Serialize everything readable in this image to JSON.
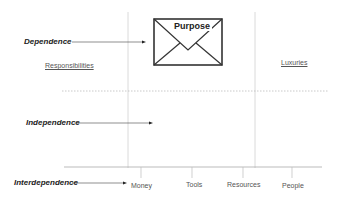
{
  "diagram": {
    "rows": [
      {
        "label": "Dependence"
      },
      {
        "label": "Independence"
      },
      {
        "label": "Interdependence"
      }
    ],
    "quadrant_labels": {
      "left": "Responsibilities",
      "right": "Luxuries"
    },
    "envelope": {
      "title": "Purpose"
    },
    "axis": {
      "ticks": [
        "Money",
        "Tools",
        "Resources",
        "People"
      ]
    }
  }
}
